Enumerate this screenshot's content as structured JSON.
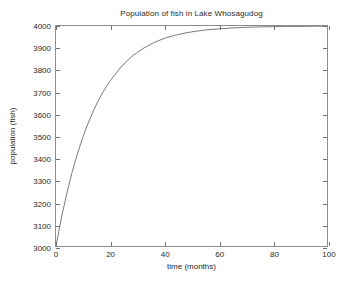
{
  "chart_data": {
    "type": "line",
    "title": "Population of fish in Lake Whosagudog",
    "xlabel": "time (months)",
    "ylabel": "population (fish)",
    "xlim": [
      0,
      100
    ],
    "ylim": [
      3000,
      4000
    ],
    "xticks": [
      0,
      20,
      40,
      60,
      80,
      100
    ],
    "xtick_labels": [
      "0",
      "20",
      "40",
      "60",
      "80",
      "100"
    ],
    "yticks": [
      3000,
      3100,
      3200,
      3300,
      3400,
      3500,
      3600,
      3700,
      3800,
      3900,
      4000
    ],
    "ytick_labels": [
      "3000",
      "3100",
      "3200",
      "3300",
      "3400",
      "3500",
      "3600",
      "3700",
      "3800",
      "3900",
      "4000"
    ],
    "grid": false,
    "legend": null,
    "line_color": "#7a7a7a",
    "line_width": 1,
    "series": [
      {
        "name": "population",
        "x": [
          0,
          2,
          4,
          6,
          8,
          10,
          12,
          14,
          16,
          18,
          20,
          24,
          28,
          32,
          36,
          40,
          44,
          48,
          52,
          56,
          60,
          65,
          70,
          75,
          80,
          85,
          90,
          95,
          100
        ],
        "values": [
          3000,
          3128,
          3240,
          3338,
          3423,
          3498,
          3563,
          3620,
          3670,
          3713,
          3751,
          3814,
          3862,
          3897,
          3924,
          3944,
          3958,
          3969,
          3977,
          3983,
          3987,
          3991,
          3994,
          3996,
          3997,
          3998,
          3998,
          3999,
          3999
        ]
      }
    ]
  }
}
